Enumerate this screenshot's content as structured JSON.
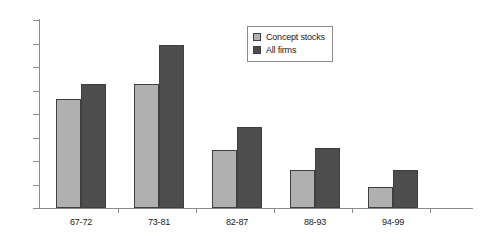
{
  "chart_data": {
    "type": "bar",
    "title": "",
    "xlabel": "",
    "ylabel": "",
    "categories": [
      "67-72",
      "73-81",
      "82-87",
      "88-93",
      "94-99"
    ],
    "series": [
      {
        "name": "Concept stocks",
        "color": "#b0b0b0",
        "values": [
          23.3,
          26.3,
          12.3,
          8.1,
          4.5
        ]
      },
      {
        "name": "All firms",
        "color": "#4d4d4d",
        "values": [
          26.3,
          34.6,
          17.3,
          12.8,
          8.1
        ]
      }
    ],
    "ylim": [
      0,
      40
    ],
    "yticks": [
      0,
      5,
      10,
      15,
      20,
      25,
      30,
      35,
      40
    ],
    "ytick_labels": [
      "0",
      "5",
      "10",
      "15",
      "20",
      "25",
      "30",
      "35",
      "40"
    ],
    "grid": false,
    "legend_position": "top-center"
  }
}
